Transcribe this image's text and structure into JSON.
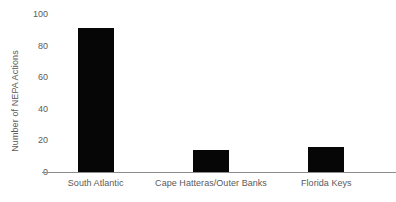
{
  "chart_data": {
    "type": "bar",
    "title": "",
    "subtitle": "",
    "xlabel": "",
    "ylabel": "Number of NEPA Actions",
    "categories": [
      "South Atlantic",
      "Cape Hatteras/Outer Banks",
      "Florida Keys"
    ],
    "values": [
      91,
      14,
      16
    ],
    "series": [
      {
        "name": "Number of NEPA Actions",
        "values": [
          91,
          14,
          16
        ]
      }
    ],
    "ylim": [
      0,
      100
    ],
    "yticks": [
      0,
      20,
      40,
      60,
      80,
      100
    ],
    "ytick_labels": [
      "0",
      "20",
      "40",
      "60",
      "80",
      "100"
    ],
    "grid": false,
    "legend": false,
    "legend_position": "none",
    "bar_color": "#060606",
    "axis_color": "#8c8c8c",
    "text_color": "#5a5a5a",
    "background_color": "#ffffff"
  },
  "axis": {
    "y_title": "Number of NEPA Actions"
  }
}
